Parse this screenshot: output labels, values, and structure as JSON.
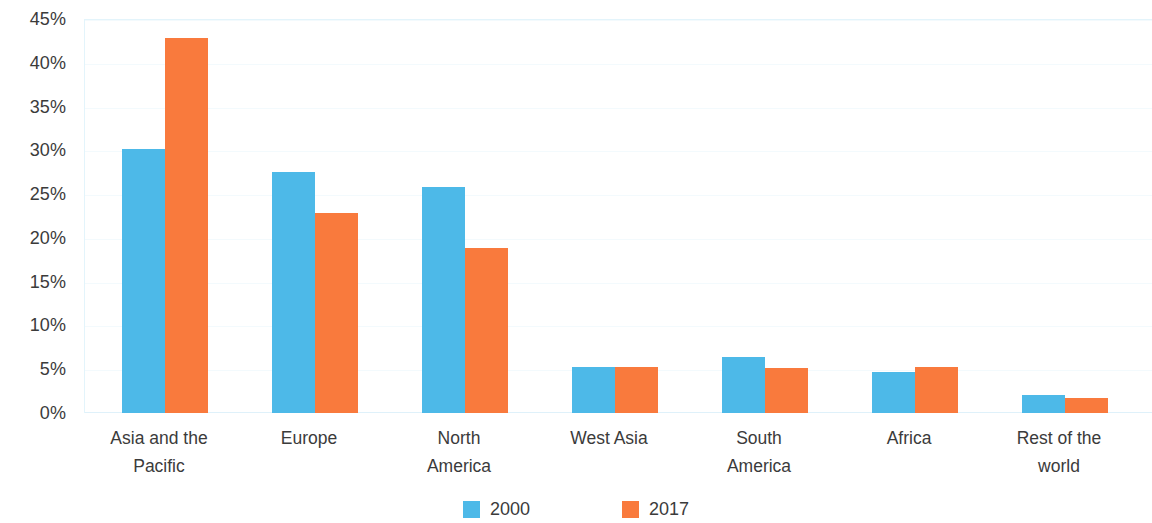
{
  "chart_data": {
    "type": "bar",
    "title": "",
    "subtitle": "",
    "xlabel": "",
    "ylabel": "",
    "ylim": [
      0,
      45
    ],
    "ytick_values": [
      0,
      5,
      10,
      15,
      20,
      25,
      30,
      35,
      40,
      45
    ],
    "ytick_labels": [
      "0%",
      "5%",
      "10%",
      "15%",
      "20%",
      "25%",
      "30%",
      "35%",
      "40%",
      "45%"
    ],
    "grid": true,
    "grid_axis": "y",
    "legend_position": "bottom-center",
    "value_unit": "%",
    "categories": [
      "Asia and the\nPacific",
      "Europe",
      "North\nAmerica",
      "West Asia",
      "South\nAmerica",
      "Africa",
      "Rest of the\nworld"
    ],
    "series": [
      {
        "name": "2000",
        "color": "#4db9e8",
        "values": [
          30.2,
          27.5,
          25.8,
          5.2,
          6.4,
          4.7,
          2.1
        ]
      },
      {
        "name": "2017",
        "color": "#f97a3d",
        "values": [
          42.8,
          22.8,
          18.9,
          5.2,
          5.1,
          5.3,
          1.7
        ]
      }
    ]
  },
  "colors": {
    "series_2000": "#4db9e8",
    "series_2017": "#f97a3d",
    "text": "#3b3b3b",
    "gridline": "#f3fafd",
    "axis": "#e3f4fb",
    "background": "#ffffff"
  }
}
